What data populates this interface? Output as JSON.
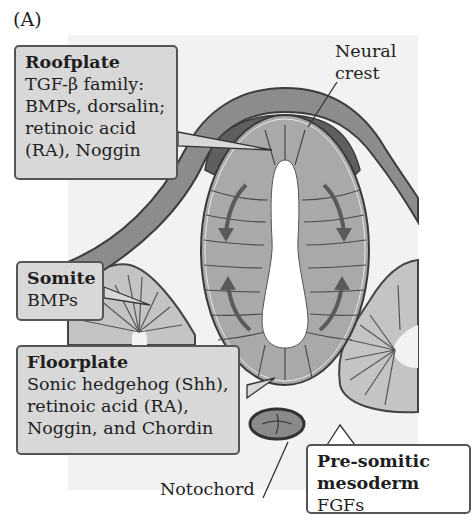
{
  "figure": {
    "panel_label": "(A)"
  },
  "callouts": {
    "roofplate": {
      "heading": "Roofplate",
      "lines": [
        "TGF-β family:",
        "BMPs, dorsalin;",
        "retinoic acid",
        "(RA), Noggin"
      ]
    },
    "somite": {
      "heading": "Somite",
      "lines": [
        "BMPs"
      ]
    },
    "floorplate": {
      "heading": "Floorplate",
      "lines": [
        "Sonic hedgehog (Shh),",
        "retinoic acid (RA),",
        "Noggin, and Chordin"
      ]
    },
    "presomitic": {
      "heading_line1": "Pre-somitic",
      "heading_line2": "mesoderm",
      "signal": "FGFs"
    }
  },
  "labels": {
    "neural_crest_line1": "Neural",
    "neural_crest_line2": "crest",
    "notochord": "Notochord"
  },
  "colors": {
    "ectoderm": "#8c8c8c",
    "neural_crest": "#5f5f5f",
    "neural_tube": "#a9a9a9",
    "somite": "#c4c4c4",
    "callout_fill": "#d8d8d8",
    "arrow": "#5a5a5a"
  }
}
